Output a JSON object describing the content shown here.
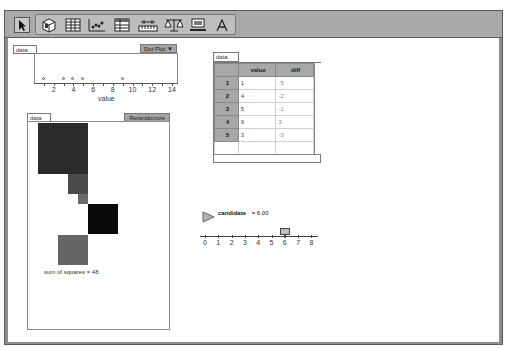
{
  "toolbar": {
    "tools": [
      {
        "name": "arrow-tool",
        "icon": "pointer-arrow-icon"
      },
      {
        "name": "case-table-cube",
        "icon": "cube-icon"
      },
      {
        "name": "table-tool",
        "icon": "table-icon"
      },
      {
        "name": "graph-tool",
        "icon": "scatter-graph-icon"
      },
      {
        "name": "summary-table-tool",
        "icon": "summary-table-icon"
      },
      {
        "name": "slider-tool",
        "icon": "slider-ruler-icon"
      },
      {
        "name": "estimate-tool",
        "icon": "balance-scale-icon"
      },
      {
        "name": "calculator-tool",
        "icon": "monitor-icon"
      },
      {
        "name": "text-tool",
        "icon": "text-a-icon"
      }
    ]
  },
  "dotplot": {
    "tab_label": "data",
    "menu_label": "Dot Plot",
    "axis_label": "value",
    "ticks": [
      "2",
      "4",
      "6",
      "8",
      "10",
      "12",
      "14"
    ],
    "values": [
      1,
      3,
      4,
      5,
      9
    ]
  },
  "squares": {
    "tab_label": "data",
    "button_label": "Rerandomize",
    "sum_text": "sum of squares = 48",
    "items": [
      {
        "value": 1,
        "diff": -5,
        "color": "#2b2b2b"
      },
      {
        "value": 4,
        "diff": -2,
        "color": "#4a4a4a"
      },
      {
        "value": 5,
        "diff": -1,
        "color": "#6a6a6a"
      },
      {
        "value": 9,
        "diff": 3,
        "color": "#0a0a0a"
      },
      {
        "value": 3,
        "diff": -3,
        "color": "#666666"
      }
    ]
  },
  "table": {
    "tab_label": "data",
    "columns": [
      "value",
      "diff"
    ],
    "rows": [
      {
        "index": "1",
        "value": "1",
        "diff": "-5"
      },
      {
        "index": "2",
        "value": "4",
        "diff": "-2"
      },
      {
        "index": "3",
        "value": "5",
        "diff": "-1"
      },
      {
        "index": "4",
        "value": "9",
        "diff": "3"
      },
      {
        "index": "5",
        "value": "3",
        "diff": "-3"
      }
    ]
  },
  "slider": {
    "label": "candidate",
    "value_text": "= 6.00",
    "ticks": [
      "0",
      "1",
      "2",
      "3",
      "4",
      "5",
      "6",
      "7",
      "8"
    ],
    "value": 6
  }
}
